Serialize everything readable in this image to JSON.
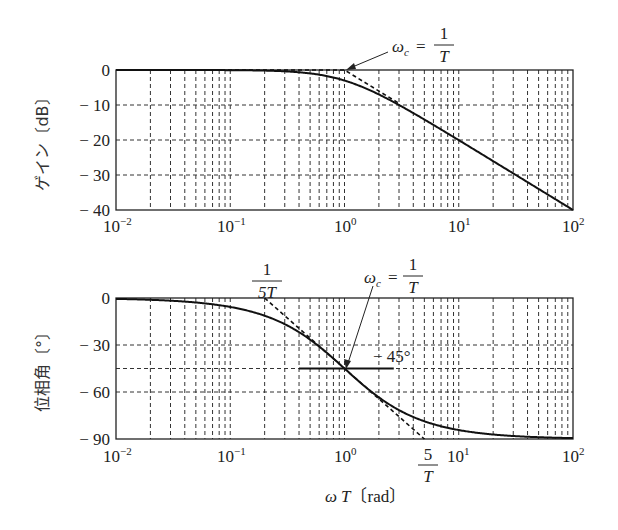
{
  "chart_data": [
    {
      "type": "line",
      "title": "Gain plot (Bode magnitude) of first-order lag 1/(1+jωT)",
      "xlabel": "",
      "ylabel": "ゲイン〔dB〕",
      "xscale": "log",
      "xlim": [
        0.01,
        100
      ],
      "ylim": [
        -40,
        0
      ],
      "x_tick_labels": [
        "10⁻²",
        "10⁻¹",
        "10⁰",
        "10¹",
        "10²"
      ],
      "y_ticks": [
        0,
        -10,
        -20,
        -30,
        -40
      ],
      "y_tick_labels": [
        "0",
        "− 10",
        "− 20",
        "− 30",
        "− 40"
      ],
      "grid": true,
      "grid_style": "dashed",
      "series": [
        {
          "name": "exact gain",
          "style": "solid",
          "x": [
            0.01,
            0.1,
            0.3,
            0.5,
            1,
            2,
            3,
            5,
            10,
            20,
            50,
            100
          ],
          "values": [
            0,
            -0.04,
            -0.37,
            -0.97,
            -3.01,
            -6.99,
            -10.0,
            -14.15,
            -20.04,
            -26.03,
            -33.98,
            -40.0
          ]
        },
        {
          "name": "asymptote",
          "style": "dashed",
          "x": [
            0.01,
            1,
            3
          ],
          "values": [
            0,
            0,
            -9.54
          ]
        }
      ],
      "annotations": [
        {
          "text": "ωc = 1/T",
          "points_to": {
            "x": 1,
            "y": 0
          }
        }
      ]
    },
    {
      "type": "line",
      "title": "Phase plot (Bode phase) of first-order lag 1/(1+jωT)",
      "xlabel": "ωT〔rad〕",
      "ylabel": "位相角〔°〕",
      "xscale": "log",
      "xlim": [
        0.01,
        100
      ],
      "ylim": [
        -90,
        0
      ],
      "x_tick_labels": [
        "10⁻²",
        "10⁻¹",
        "10⁰",
        "10¹",
        "10²"
      ],
      "y_ticks": [
        0,
        -30,
        -60,
        -90
      ],
      "y_tick_labels": [
        "0",
        "− 30",
        "− 60",
        "− 90"
      ],
      "grid": true,
      "grid_style": "dashed",
      "series": [
        {
          "name": "exact phase",
          "style": "solid",
          "x": [
            0.01,
            0.05,
            0.1,
            0.2,
            0.5,
            1,
            2,
            5,
            10,
            20,
            50,
            100
          ],
          "values": [
            -0.57,
            -2.86,
            -5.71,
            -11.31,
            -26.57,
            -45,
            -63.43,
            -78.69,
            -84.29,
            -87.14,
            -88.85,
            -89.43
          ]
        },
        {
          "name": "asymptote",
          "style": "dashed",
          "x": [
            0.2,
            5
          ],
          "values": [
            0,
            -90
          ]
        },
        {
          "name": "-45° reference line",
          "style": "solid",
          "x": [
            0.4,
            2.7
          ],
          "values": [
            -45,
            -45
          ]
        }
      ],
      "annotations": [
        {
          "text": "1/(5T)",
          "at_x": 0.2
        },
        {
          "text": "ωc = 1/T",
          "points_to": {
            "x": 1,
            "y": -45
          }
        },
        {
          "text": "− 45°",
          "at": {
            "x": 2.0,
            "y": -40
          }
        },
        {
          "text": "5/T",
          "at_x": 5
        }
      ]
    }
  ],
  "labels": {
    "gain_ylabel": "ゲイン〔dB〕",
    "phase_ylabel": "位相角〔°〕",
    "xlabel_omega": "ω",
    "xlabel_T": "T",
    "xlabel_unit": "〔rad〕",
    "omega_c": "ω",
    "omega_c_sub": "c",
    "equals": "=",
    "one": "1",
    "T": "T",
    "fivT_num": "1",
    "fivT_den": "5T",
    "five_over_T_num": "5",
    "five_over_T_den": "T",
    "minus45": "− 45°",
    "x_ticks": [
      "10",
      "10",
      "10",
      "10",
      "10"
    ],
    "x_exps": [
      "−2",
      "−1",
      "0",
      "1",
      "2"
    ],
    "gain_y": [
      "0",
      "− 10",
      "− 20",
      "− 30",
      "− 40"
    ],
    "phase_y": [
      "0",
      "− 30",
      "− 60",
      "− 90"
    ]
  },
  "colors": {
    "ink": "#1a1a1a",
    "grid": "#333333",
    "background": "#ffffff"
  }
}
